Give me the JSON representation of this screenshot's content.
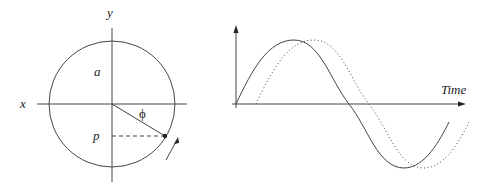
{
  "circle_diagram": {
    "labels": {
      "x_axis": "x",
      "y_axis": "y",
      "amplitude": "a",
      "projection": "p",
      "phase": "ϕ"
    }
  },
  "wave_diagram": {
    "labels": {
      "time_axis": "Time"
    },
    "series": [
      {
        "name": "reference wave",
        "style": "solid"
      },
      {
        "name": "phase-shifted wave",
        "style": "dotted"
      }
    ]
  }
}
